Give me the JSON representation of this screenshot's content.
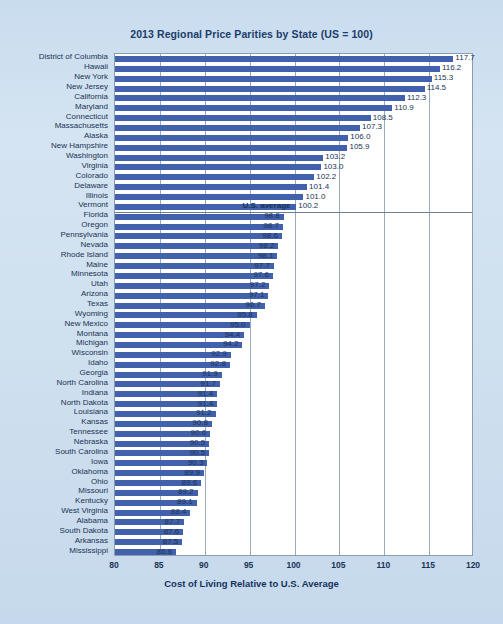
{
  "chart_data": {
    "type": "bar",
    "orientation": "horizontal",
    "title": "2013 Regional Price Parities by State (US = 100)",
    "xlabel": "Cost of Living Relative to U.S. Average",
    "ylabel": "",
    "xlim": [
      80,
      120
    ],
    "xticks": [
      80,
      85,
      90,
      95,
      100,
      105,
      110,
      115,
      120
    ],
    "grid": true,
    "grid_axis": "x",
    "legend": null,
    "bar_color": "#4161ac",
    "plot_background": "#ffffff",
    "figure_background": "#cfe0ef",
    "annotations": [
      {
        "text": "U.S. average",
        "value": 100,
        "after_category": "Vermont"
      }
    ],
    "categories": [
      "District of Columbia",
      "Hawaii",
      "New York",
      "New Jersey",
      "California",
      "Maryland",
      "Connecticut",
      "Massachusetts",
      "Alaska",
      "New Hampshire",
      "Washington",
      "Virginia",
      "Colorado",
      "Delaware",
      "Illinois",
      "Vermont",
      "Florida",
      "Oregon",
      "Pennsylvania",
      "Nevada",
      "Rhode Island",
      "Maine",
      "Minnesota",
      "Utah",
      "Arizona",
      "Texas",
      "Wyoming",
      "New Mexico",
      "Montana",
      "Michigan",
      "Wisconsin",
      "Idaho",
      "Georgia",
      "North Carolina",
      "Indiana",
      "North Dakota",
      "Louisiana",
      "Kansas",
      "Tennessee",
      "Nebraska",
      "South Carolina",
      "Iowa",
      "Oklahoma",
      "Ohio",
      "Missouri",
      "Kentucky",
      "West Virginia",
      "Alabama",
      "South Dakota",
      "Arkansas",
      "Mississippi"
    ],
    "values": [
      117.7,
      116.2,
      115.3,
      114.5,
      112.3,
      110.9,
      108.5,
      107.3,
      106.0,
      105.9,
      103.2,
      103.0,
      102.2,
      101.4,
      101.0,
      100.2,
      98.8,
      98.7,
      98.6,
      98.2,
      98.1,
      97.7,
      97.6,
      97.2,
      97.1,
      96.7,
      95.8,
      95.0,
      94.4,
      94.2,
      92.9,
      92.8,
      91.9,
      91.7,
      91.4,
      91.4,
      91.2,
      90.8,
      90.6,
      90.5,
      90.5,
      90.3,
      89.9,
      89.6,
      89.2,
      89.1,
      88.4,
      87.7,
      87.6,
      87.5,
      86.8
    ],
    "value_labels": [
      "117.7",
      "116.2",
      "115.3",
      "114.5",
      "112.3",
      "110.9",
      "108.5",
      "107.3",
      "106.0",
      "105.9",
      "103.2",
      "103.0",
      "102.2",
      "101.4",
      "101.0",
      "100.2",
      "98.8",
      "98.7",
      "98.6",
      "98.2",
      "98.1",
      "97.7",
      "97.6",
      "97.2",
      "97.1",
      "96.7",
      "95.8",
      "95.0",
      "94.4",
      "94.2",
      "92.9",
      "92.8",
      "91.9",
      "91.7",
      "91.4",
      "91.4",
      "91.2",
      "90.8",
      "90.6",
      "90.5",
      "90.5",
      "90.3",
      "89.9",
      "89.6",
      "89.2",
      "89.1",
      "88.4",
      "87.7",
      "87.6",
      "87.5",
      "86.8"
    ],
    "xtick_labels": [
      "80",
      "85",
      "90",
      "95",
      "100",
      "105",
      "110",
      "115",
      "120"
    ]
  }
}
